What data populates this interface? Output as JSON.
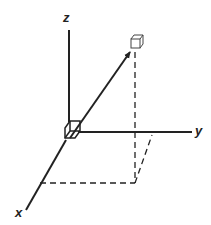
{
  "diagram": {
    "type": "3d-coordinate-system",
    "axes": [
      {
        "name": "z",
        "label": "z",
        "direction": "up"
      },
      {
        "name": "y",
        "label": "y",
        "direction": "right"
      },
      {
        "name": "x",
        "label": "x",
        "direction": "down-left"
      }
    ],
    "elements": {
      "origin_cube": "small volume element at origin",
      "target_cube": "small volume element at point",
      "position_vector": "arrow from origin to point",
      "projection_lines": "dashed lines projecting point onto xy-plane"
    },
    "colors": {
      "stroke": "#222222",
      "background": "#ffffff"
    }
  }
}
